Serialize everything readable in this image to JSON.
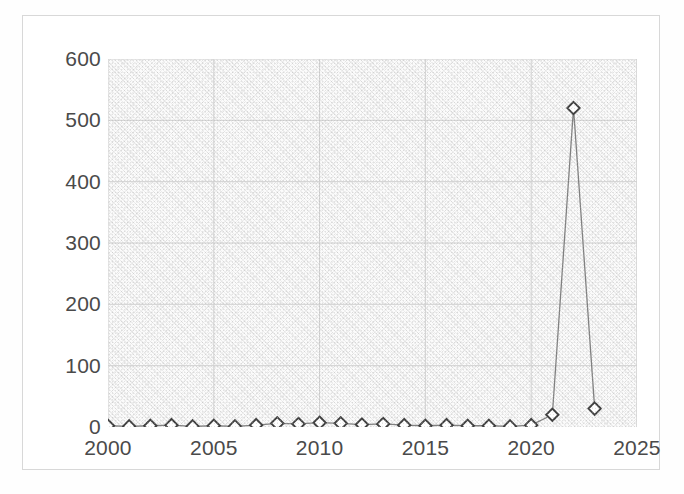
{
  "chart_data": {
    "type": "line",
    "title": "",
    "subtitle": "",
    "xlabel": "",
    "ylabel": "",
    "xlim": [
      2000,
      2025
    ],
    "ylim": [
      0,
      600
    ],
    "x_ticks": [
      "2000",
      "2005",
      "2010",
      "2015",
      "2020",
      "2025"
    ],
    "x_tick_values": [
      2000,
      2005,
      2010,
      2015,
      2020,
      2025
    ],
    "y_ticks": [
      "0",
      "100",
      "200",
      "300",
      "400",
      "500",
      "600"
    ],
    "y_tick_values": [
      0,
      100,
      200,
      300,
      400,
      500,
      600
    ],
    "grid": true,
    "legend": "none",
    "marker": "diamond-open",
    "line_color": "#808080",
    "marker_edge_color": "#404040",
    "marker_face_color": "#ffffff",
    "plot_bg_color": "#fbfbfb",
    "grid_color": "#d0d0d0",
    "frame_color": "#d8d8d8",
    "tick_label_color": "#4a4a4a",
    "x": [
      2000,
      2001,
      2002,
      2003,
      2004,
      2005,
      2006,
      2007,
      2008,
      2009,
      2010,
      2011,
      2012,
      2013,
      2014,
      2015,
      2016,
      2017,
      2018,
      2019,
      2020,
      2021,
      2022,
      2023
    ],
    "values": [
      2,
      1,
      2,
      3,
      1,
      2,
      1,
      3,
      6,
      5,
      7,
      6,
      4,
      5,
      3,
      2,
      3,
      2,
      2,
      1,
      3,
      20,
      520,
      30
    ],
    "series": [
      {
        "name": "series-1",
        "values": [
          2,
          1,
          2,
          3,
          1,
          2,
          1,
          3,
          6,
          5,
          7,
          6,
          4,
          5,
          3,
          2,
          3,
          2,
          2,
          1,
          3,
          20,
          520,
          30
        ]
      }
    ]
  }
}
